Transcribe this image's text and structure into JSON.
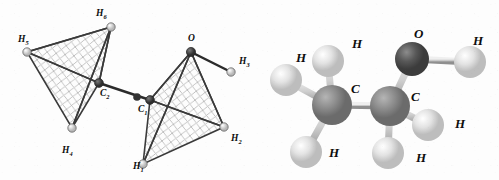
{
  "figure": {
    "molecule_name": "ethanol",
    "background_color": "#fdfdfd",
    "panels": [
      {
        "id": "tetrahedral-diagram",
        "caption": ""
      },
      {
        "id": "ball-and-stick-model",
        "caption": ""
      }
    ]
  },
  "colors": {
    "bond_line": "#2b2b2b",
    "hatch_line": "#b4b4b4",
    "edge_line": "#3a3a3a",
    "carbon_sphere": "#8a8a8a",
    "oxygen_sphere": "#565656",
    "hydrogen_sphere": "#d9d9d9",
    "node_dark": "#3d3d3d",
    "node_light": "#cfcfcf",
    "label_text": "#0d0d0d"
  },
  "tetrahedral": {
    "labels": [
      {
        "name": "H6",
        "element": "H",
        "subscript": "6",
        "x": 96,
        "y": 16
      },
      {
        "name": "H5",
        "element": "H",
        "subscript": "5",
        "x": 18,
        "y": 42
      },
      {
        "name": "O",
        "element": "O",
        "subscript": "",
        "x": 188,
        "y": 41
      },
      {
        "name": "H3",
        "element": "H",
        "subscript": "3",
        "x": 239,
        "y": 64
      },
      {
        "name": "C2",
        "element": "C",
        "subscript": "2",
        "x": 100,
        "y": 96
      },
      {
        "name": "C1",
        "element": "C",
        "subscript": "1",
        "x": 138,
        "y": 112
      },
      {
        "name": "H2",
        "element": "H",
        "subscript": "2",
        "x": 231,
        "y": 141
      },
      {
        "name": "H4",
        "element": "H",
        "subscript": "4",
        "x": 62,
        "y": 153
      },
      {
        "name": "H1",
        "element": "H",
        "subscript": "1",
        "x": 133,
        "y": 169
      }
    ],
    "vertices": [
      {
        "name": "h6-vertex",
        "x": 111,
        "y": 27,
        "kind": "light"
      },
      {
        "name": "h5-vertex",
        "x": 27,
        "y": 52,
        "kind": "light"
      },
      {
        "name": "c2-center",
        "x": 99,
        "y": 83,
        "kind": "dark"
      },
      {
        "name": "h4-vertex",
        "x": 72,
        "y": 128,
        "kind": "light"
      },
      {
        "name": "bond-node",
        "x": 137,
        "y": 97,
        "kind": "dark"
      },
      {
        "name": "c1-center",
        "x": 150,
        "y": 100,
        "kind": "dark"
      },
      {
        "name": "o-vertex",
        "x": 191,
        "y": 52,
        "kind": "dark"
      },
      {
        "name": "h3-vertex",
        "x": 231,
        "y": 72,
        "kind": "light"
      },
      {
        "name": "h2-vertex",
        "x": 224,
        "y": 127,
        "kind": "light"
      },
      {
        "name": "h1-vertex",
        "x": 143,
        "y": 164,
        "kind": "light"
      }
    ]
  },
  "ballstick": {
    "labels": [
      {
        "name": "H-methyl-top",
        "element": "H",
        "x": 48,
        "y": 62
      },
      {
        "name": "H-methyl-upper",
        "element": "H",
        "x": 104,
        "y": 48
      },
      {
        "name": "O-hydroxyl",
        "element": "O",
        "x": 166,
        "y": 38
      },
      {
        "name": "H-hydroxyl",
        "element": "H",
        "x": 225,
        "y": 45
      },
      {
        "name": "C-methyl",
        "element": "C",
        "x": 103,
        "y": 93
      },
      {
        "name": "C-methylene",
        "element": "C",
        "x": 163,
        "y": 101
      },
      {
        "name": "H-methylene-rt",
        "element": "H",
        "x": 207,
        "y": 128
      },
      {
        "name": "H-methyl-low",
        "element": "H",
        "x": 81,
        "y": 157
      },
      {
        "name": "H-methylene-lo",
        "element": "H",
        "x": 168,
        "y": 162
      }
    ],
    "atoms": [
      {
        "name": "oxygen-atom",
        "element": "O",
        "x": 164,
        "y": 59,
        "r": 17,
        "kind": "oxygen"
      },
      {
        "name": "hydroxyl-h-atom",
        "element": "H",
        "x": 222,
        "y": 62,
        "r": 16,
        "kind": "hydrogen"
      },
      {
        "name": "carbon-methylene",
        "element": "C",
        "x": 142,
        "y": 106,
        "r": 20,
        "kind": "carbon"
      },
      {
        "name": "carbon-methyl",
        "element": "C",
        "x": 84,
        "y": 105,
        "r": 20,
        "kind": "carbon"
      },
      {
        "name": "h-methyl-up",
        "element": "H",
        "x": 80,
        "y": 61,
        "r": 16,
        "kind": "hydrogen"
      },
      {
        "name": "h-methyl-left",
        "element": "H",
        "x": 38,
        "y": 80,
        "r": 16,
        "kind": "hydrogen"
      },
      {
        "name": "h-methyl-down",
        "element": "H",
        "x": 58,
        "y": 152,
        "r": 16,
        "kind": "hydrogen"
      },
      {
        "name": "h-methylene-rt",
        "element": "H",
        "x": 180,
        "y": 125,
        "r": 16,
        "kind": "hydrogen"
      },
      {
        "name": "h-methylene-dn",
        "element": "H",
        "x": 140,
        "y": 153,
        "r": 16,
        "kind": "hydrogen"
      }
    ],
    "bonds": [
      {
        "name": "bond-c-c",
        "x1": 84,
        "y1": 105,
        "x2": 142,
        "y2": 106
      },
      {
        "name": "bond-c-o",
        "x1": 142,
        "y1": 106,
        "x2": 164,
        "y2": 59
      },
      {
        "name": "bond-o-h",
        "x1": 164,
        "y1": 59,
        "x2": 222,
        "y2": 62
      },
      {
        "name": "bond-c-h1",
        "x1": 84,
        "y1": 105,
        "x2": 80,
        "y2": 61
      },
      {
        "name": "bond-c-h2",
        "x1": 84,
        "y1": 105,
        "x2": 38,
        "y2": 80
      },
      {
        "name": "bond-c-h3",
        "x1": 84,
        "y1": 105,
        "x2": 58,
        "y2": 152
      },
      {
        "name": "bond-c-h4",
        "x1": 142,
        "y1": 106,
        "x2": 180,
        "y2": 125
      },
      {
        "name": "bond-c-h5",
        "x1": 142,
        "y1": 106,
        "x2": 140,
        "y2": 153
      }
    ]
  }
}
